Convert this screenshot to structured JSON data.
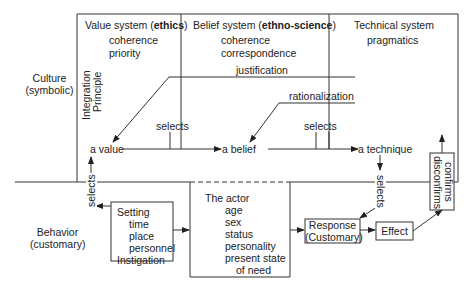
{
  "diagram": {
    "levels": {
      "culture": {
        "line1": "Culture",
        "line2": "(symbolic)"
      },
      "behavior": {
        "line1": "Behavior",
        "line2": "(customary)"
      }
    },
    "integration_principle": {
      "line1": "Integration",
      "line2": "Principle"
    },
    "systems": [
      {
        "title_a": "Value system (",
        "title_b": "ethics",
        "title_c": ")",
        "items": [
          "coherence",
          "priority"
        ]
      },
      {
        "title_a": "Belief system (",
        "title_b": "ethno-science",
        "title_c": ")",
        "items": [
          "coherence",
          "correspondence"
        ]
      },
      {
        "title_a": "Technical system",
        "items": [
          "pragmatics"
        ]
      }
    ],
    "labels": {
      "justification": "justification",
      "rationalization": "rationalization",
      "selects_1": "selects",
      "selects_2": "selects",
      "selects_left": "selects",
      "selects_right": "selects",
      "a_value": "a value",
      "a_belief": "a belief",
      "a_technique": "a technique"
    },
    "setting_box": {
      "title": "Setting",
      "items": [
        "time",
        "place",
        "personnel"
      ],
      "footer": "Instigation"
    },
    "actor_box": {
      "title": "The actor",
      "items": [
        "age",
        "sex",
        "status",
        "personality",
        "present state",
        "of need"
      ]
    },
    "response_box": {
      "line1": "Response",
      "line2": "(Customary)"
    },
    "effect_box": {
      "label": "Effect"
    },
    "confirm_box": {
      "line1": "confirms",
      "line2": "disconfirms"
    }
  }
}
